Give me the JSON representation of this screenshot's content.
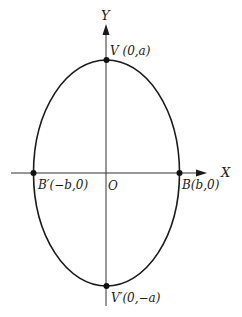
{
  "diagram": {
    "type": "ellipse-on-axes",
    "axes": {
      "x_label": "X",
      "y_label": "Y",
      "origin_label": "O"
    },
    "points": [
      {
        "id": "V",
        "label": "V (0,a)",
        "position": "top"
      },
      {
        "id": "V_prime",
        "label": "V′(0,−a)",
        "position": "bottom"
      },
      {
        "id": "B",
        "label": "B(b,0)",
        "position": "right"
      },
      {
        "id": "B_prime",
        "label": "B′(−b,0)",
        "position": "left"
      }
    ],
    "colors": {
      "stroke": "#1a1a1a",
      "axis": "#333333",
      "background": "#ffffff"
    }
  }
}
